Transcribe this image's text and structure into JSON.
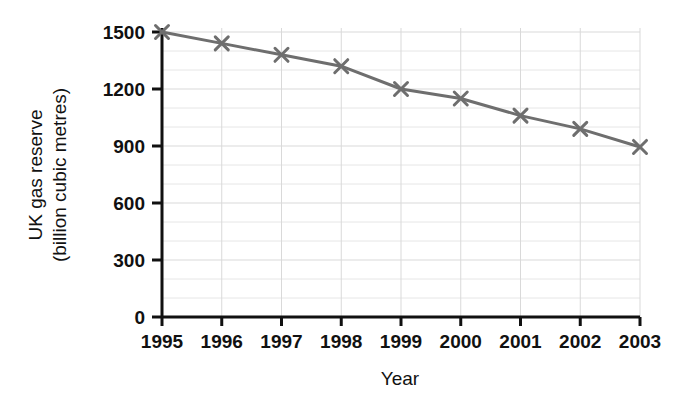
{
  "chart_data": {
    "type": "line",
    "title": "",
    "xlabel": "Year",
    "ylabel": "UK gas reserve (billion cubic metres)",
    "ylabel_line1": "UK gas reserve",
    "ylabel_line2": "(billion cubic metres)",
    "categories": [
      "1995",
      "1996",
      "1997",
      "1998",
      "1999",
      "2000",
      "2001",
      "2002",
      "2003"
    ],
    "values": [
      1500,
      1440,
      1380,
      1320,
      1200,
      1150,
      1060,
      990,
      895
    ],
    "series": [
      {
        "name": "UK gas reserve",
        "values": [
          1500,
          1440,
          1380,
          1320,
          1200,
          1150,
          1060,
          990,
          895
        ]
      }
    ],
    "ylim": [
      0,
      1500
    ],
    "y_ticks": [
      0,
      300,
      600,
      900,
      1200,
      1500
    ],
    "y_tick_labels": [
      "0",
      "300",
      "600",
      "900",
      "1200",
      "1500"
    ],
    "y_minor_step": 100,
    "x_ticks": [
      "1995",
      "1996",
      "1997",
      "1998",
      "1999",
      "2000",
      "2001",
      "2002",
      "2003"
    ],
    "grid": true,
    "grid_color": "#d9d9d9",
    "legend": false,
    "legend_position": "none",
    "line_color": "#6e6e6e",
    "marker": "x",
    "axis_color": "#111111"
  }
}
